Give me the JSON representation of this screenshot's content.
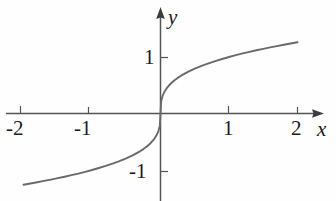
{
  "figure": {
    "name": "cube-root-function-graph",
    "background_color": "#fefefe",
    "ink_color": "#4a4a4a",
    "text_color": "#1b1b1b"
  },
  "axis_labels": {
    "x": "x",
    "y": "y"
  },
  "chart_data": {
    "type": "line",
    "title": "",
    "subtitle": "",
    "xlabel": "x",
    "ylabel": "y",
    "xlim": [
      -2.2,
      2.2
    ],
    "ylim": [
      -1.6,
      1.6
    ],
    "grid": false,
    "legend": "none",
    "xticks": [
      -2,
      -1,
      1,
      2
    ],
    "xtick_labels": [
      "-2",
      "-1",
      "1",
      "2"
    ],
    "yticks": [
      1,
      -1
    ],
    "ytick_labels": [
      "1",
      "-1"
    ],
    "axis_arrows": [
      "x-positive",
      "y-positive"
    ],
    "series": [
      {
        "name": "y = cube root of x",
        "x": [
          -2.0,
          -1.9,
          -1.8,
          -1.7,
          -1.6,
          -1.5,
          -1.4,
          -1.3,
          -1.2,
          -1.1,
          -1.0,
          -0.9,
          -0.8,
          -0.7,
          -0.6,
          -0.5,
          -0.4,
          -0.3,
          -0.25,
          -0.2,
          -0.15,
          -0.1,
          -0.06,
          -0.03,
          -0.01,
          0.0,
          0.01,
          0.03,
          0.06,
          0.1,
          0.15,
          0.2,
          0.25,
          0.3,
          0.4,
          0.5,
          0.6,
          0.7,
          0.8,
          0.9,
          1.0,
          1.1,
          1.2,
          1.3,
          1.4,
          1.5,
          1.6,
          1.7,
          1.8,
          1.9,
          2.0
        ],
        "y": [
          -1.26,
          -1.239,
          -1.216,
          -1.193,
          -1.17,
          -1.145,
          -1.119,
          -1.091,
          -1.063,
          -1.032,
          -1.0,
          -0.965,
          -0.928,
          -0.888,
          -0.843,
          -0.794,
          -0.737,
          -0.669,
          -0.63,
          -0.585,
          -0.531,
          -0.464,
          -0.391,
          -0.311,
          -0.215,
          0.0,
          0.215,
          0.311,
          0.391,
          0.464,
          0.531,
          0.585,
          0.63,
          0.669,
          0.737,
          0.794,
          0.843,
          0.888,
          0.928,
          0.965,
          1.0,
          1.032,
          1.063,
          1.091,
          1.119,
          1.145,
          1.17,
          1.193,
          1.216,
          1.239,
          1.26
        ]
      }
    ]
  }
}
